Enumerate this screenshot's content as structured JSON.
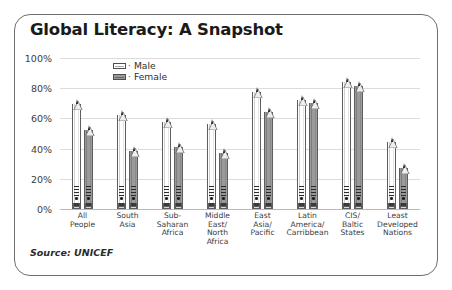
{
  "title": "Global Literacy: A Snapshot",
  "source": "Source: UNICEF",
  "legend": {
    "male_label": "Male",
    "female_label": "Female",
    "separator": "·"
  },
  "axis": {
    "ticks": [
      "100%",
      "80%",
      "60%",
      "40%",
      "20%",
      "0%"
    ]
  },
  "chart_data": {
    "type": "bar",
    "title": "Global Literacy: A Snapshot",
    "xlabel": "",
    "ylabel": "",
    "ylim": [
      0,
      100
    ],
    "yticks": [
      0,
      20,
      40,
      60,
      80,
      100
    ],
    "ytick_labels": [
      "0%",
      "20%",
      "40%",
      "60%",
      "80%",
      "100%"
    ],
    "grid": true,
    "legend_position": "top-center",
    "source": "Source: UNICEF",
    "categories": [
      "All People",
      "South Asia",
      "Sub-Saharan Africa",
      "Middle East/ North Africa",
      "East Asia/ Pacific",
      "Latin America/ Carribbean",
      "CIS/ Baltic States",
      "Least Developed Nations"
    ],
    "category_lines": [
      [
        "All",
        "People"
      ],
      [
        "South",
        "Asia"
      ],
      [
        "Sub-",
        "Saharan",
        "Africa"
      ],
      [
        "Middle",
        "East/",
        "North",
        "Africa"
      ],
      [
        "East",
        "Asia/",
        "Pacific"
      ],
      [
        "Latin",
        "America/",
        "Carribbean"
      ],
      [
        "CIS/",
        "Baltic",
        "States"
      ],
      [
        "Least",
        "Developed",
        "Nations"
      ]
    ],
    "series": [
      {
        "name": "Male",
        "color": "#ffffff",
        "values": [
          78,
          71,
          66,
          65,
          86,
          81,
          93,
          53
        ]
      },
      {
        "name": "Female",
        "color": "#9a9a9a",
        "values": [
          61,
          47,
          50,
          46,
          73,
          79,
          90,
          36
        ]
      }
    ]
  }
}
